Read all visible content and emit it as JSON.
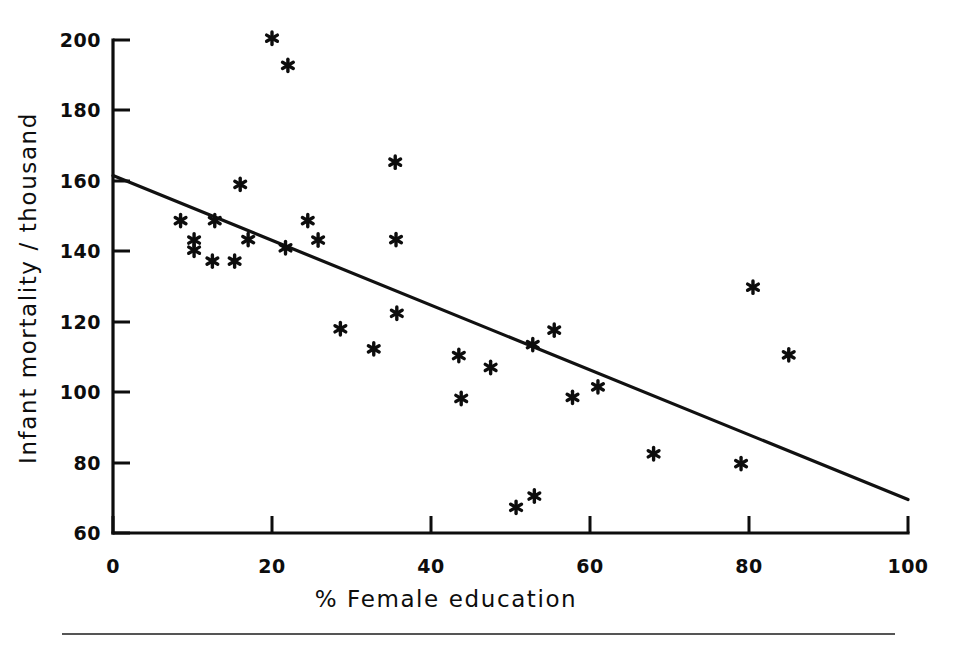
{
  "figure": {
    "background_color": "#ffffff",
    "ink_color": "#0d0d0d",
    "footer_rule_color": "#555555"
  },
  "chart_data": {
    "type": "scatter",
    "title": "",
    "subtitle": "",
    "xlabel": "% Female education",
    "ylabel": "Infant mortality / thousand",
    "xlim": [
      0,
      100
    ],
    "ylim": [
      60,
      200
    ],
    "xticks": [
      0,
      20,
      40,
      60,
      80,
      100
    ],
    "yticks": [
      60,
      80,
      100,
      120,
      140,
      160,
      180,
      200
    ],
    "xtick_labels": [
      "0",
      "20",
      "40",
      "60",
      "80",
      "100"
    ],
    "ytick_labels": [
      "60",
      "80",
      "100",
      "120",
      "140",
      "160",
      "180",
      "200"
    ],
    "grid": false,
    "legend": null,
    "legend_position": "none",
    "marker_symbol": "asterisk",
    "points": [
      {
        "x": 20.0,
        "y": 200.5
      },
      {
        "x": 22.0,
        "y": 192.8
      },
      {
        "x": 35.5,
        "y": 165.3
      },
      {
        "x": 16.0,
        "y": 159.0
      },
      {
        "x": 8.5,
        "y": 148.7
      },
      {
        "x": 12.8,
        "y": 148.7
      },
      {
        "x": 24.5,
        "y": 148.7
      },
      {
        "x": 10.2,
        "y": 143.2
      },
      {
        "x": 17.0,
        "y": 143.3
      },
      {
        "x": 25.8,
        "y": 143.2
      },
      {
        "x": 35.6,
        "y": 143.3
      },
      {
        "x": 10.2,
        "y": 140.3
      },
      {
        "x": 21.7,
        "y": 141.0
      },
      {
        "x": 12.5,
        "y": 137.2
      },
      {
        "x": 15.3,
        "y": 137.2
      },
      {
        "x": 80.5,
        "y": 129.8
      },
      {
        "x": 35.7,
        "y": 122.4
      },
      {
        "x": 28.6,
        "y": 118.0
      },
      {
        "x": 55.5,
        "y": 117.6
      },
      {
        "x": 52.8,
        "y": 113.5
      },
      {
        "x": 32.8,
        "y": 112.3
      },
      {
        "x": 43.5,
        "y": 110.4
      },
      {
        "x": 85.0,
        "y": 110.6
      },
      {
        "x": 47.5,
        "y": 107.0
      },
      {
        "x": 61.0,
        "y": 101.5
      },
      {
        "x": 57.8,
        "y": 98.5
      },
      {
        "x": 43.8,
        "y": 98.2
      },
      {
        "x": 68.0,
        "y": 82.5
      },
      {
        "x": 79.0,
        "y": 79.7
      },
      {
        "x": 53.0,
        "y": 70.5
      },
      {
        "x": 50.7,
        "y": 67.3
      }
    ],
    "trend_line": {
      "type": "linear-fit",
      "x_start": 0,
      "y_start": 161.5,
      "x_end": 100,
      "y_end": 69.5
    }
  }
}
